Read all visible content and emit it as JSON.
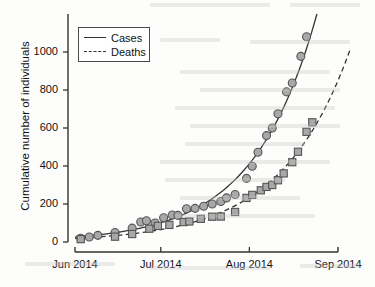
{
  "figure": {
    "background": "#fdfdfc",
    "ink_color": "#333333",
    "marker_fill": "#a8a8a8",
    "marker_stroke": "#555555"
  },
  "chart_data": {
    "type": "scatter",
    "title": "",
    "subtitle": "",
    "xlabel": "",
    "ylabel": "Cumulative number of individuals",
    "grid": false,
    "legend_position": "top-left",
    "xlim": [
      0,
      92
    ],
    "ylim": [
      0,
      1200
    ],
    "x_tick_labels": [
      "Jun 2014",
      "Jul 2014",
      "Aug 2014",
      "Sep 2014"
    ],
    "x_tick_values": [
      0,
      30,
      61,
      92
    ],
    "y_tick_labels": [
      "0",
      "200",
      "400",
      "600",
      "800",
      "1000"
    ],
    "y_tick_values": [
      0,
      200,
      400,
      600,
      800,
      1000
    ],
    "series": [
      {
        "name": "Cases",
        "marker": "circle",
        "line_style": "solid",
        "points": [
          {
            "x": 2,
            "y": 20
          },
          {
            "x": 5,
            "y": 26
          },
          {
            "x": 8,
            "y": 35
          },
          {
            "x": 14,
            "y": 50
          },
          {
            "x": 20,
            "y": 73
          },
          {
            "x": 23,
            "y": 105
          },
          {
            "x": 25,
            "y": 112
          },
          {
            "x": 28,
            "y": 100
          },
          {
            "x": 31,
            "y": 128
          },
          {
            "x": 34,
            "y": 142
          },
          {
            "x": 36,
            "y": 140
          },
          {
            "x": 39,
            "y": 175
          },
          {
            "x": 42,
            "y": 177
          },
          {
            "x": 45,
            "y": 188
          },
          {
            "x": 48,
            "y": 200
          },
          {
            "x": 51,
            "y": 213
          },
          {
            "x": 53,
            "y": 232
          },
          {
            "x": 56,
            "y": 250
          },
          {
            "x": 60,
            "y": 335
          },
          {
            "x": 62,
            "y": 399
          },
          {
            "x": 64,
            "y": 472
          },
          {
            "x": 67,
            "y": 560
          },
          {
            "x": 69,
            "y": 600
          },
          {
            "x": 71,
            "y": 675
          },
          {
            "x": 74,
            "y": 790
          },
          {
            "x": 76,
            "y": 837
          },
          {
            "x": 79,
            "y": 977
          },
          {
            "x": 81,
            "y": 1080
          }
        ],
        "fit_curve_end_y": 1200
      },
      {
        "name": "Deaths",
        "marker": "square",
        "line_style": "dashed",
        "points": [
          {
            "x": 2,
            "y": 15
          },
          {
            "x": 14,
            "y": 28
          },
          {
            "x": 20,
            "y": 42
          },
          {
            "x": 26,
            "y": 70
          },
          {
            "x": 29,
            "y": 85
          },
          {
            "x": 33,
            "y": 90
          },
          {
            "x": 38,
            "y": 105
          },
          {
            "x": 40,
            "y": 108
          },
          {
            "x": 44,
            "y": 122
          },
          {
            "x": 48,
            "y": 133
          },
          {
            "x": 51,
            "y": 134
          },
          {
            "x": 56,
            "y": 158
          },
          {
            "x": 60,
            "y": 232
          },
          {
            "x": 62,
            "y": 248
          },
          {
            "x": 65,
            "y": 272
          },
          {
            "x": 67,
            "y": 290
          },
          {
            "x": 69,
            "y": 300
          },
          {
            "x": 71,
            "y": 325
          },
          {
            "x": 73,
            "y": 361
          },
          {
            "x": 76,
            "y": 420
          },
          {
            "x": 78,
            "y": 475
          },
          {
            "x": 81,
            "y": 580
          },
          {
            "x": 83,
            "y": 630
          }
        ],
        "fit_curve_end_y": 1020
      }
    ]
  },
  "legend": {
    "entries": [
      {
        "label": "Cases",
        "style": "solid"
      },
      {
        "label": "Deaths",
        "style": "dashed"
      }
    ]
  }
}
